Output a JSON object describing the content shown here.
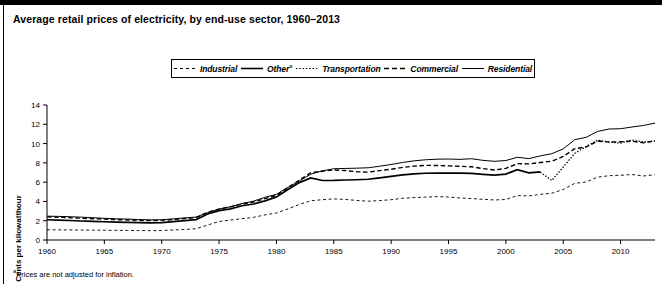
{
  "figure": {
    "title": "Average retail prices of electricity, by end-use sector, 1960–2013",
    "footnote_marker": "a",
    "footnote_text": "Prices are not adjusted for inflation.",
    "border_color": "#000000",
    "background_color": "#ffffff"
  },
  "legend": {
    "position": "top-center",
    "items": [
      {
        "label": "Industrial",
        "style": "dashed",
        "dash": "3,3",
        "width": 1,
        "color": "#000000",
        "superscript": ""
      },
      {
        "label": "Other",
        "style": "solid",
        "dash": "",
        "width": 1.6,
        "color": "#000000",
        "superscript": "a"
      },
      {
        "label": "Transportation",
        "style": "dotted",
        "dash": "1.5,1.8",
        "width": 1.2,
        "color": "#000000",
        "superscript": ""
      },
      {
        "label": "Commercial",
        "style": "dashed",
        "dash": "5,3",
        "width": 1.4,
        "color": "#000000",
        "superscript": ""
      },
      {
        "label": "Residential",
        "style": "solid",
        "dash": "",
        "width": 1,
        "color": "#000000",
        "superscript": ""
      }
    ]
  },
  "chart_data": {
    "type": "line",
    "title": "Average retail prices of electricity, by end-use sector, 1960–2013",
    "xlabel": "",
    "ylabel": "Cents per kilowatthour",
    "xlim": [
      1960,
      2013
    ],
    "ylim": [
      0,
      14
    ],
    "yticks": [
      0,
      2,
      4,
      6,
      8,
      10,
      12,
      14
    ],
    "xticks": [
      1960,
      1965,
      1970,
      1975,
      1980,
      1985,
      1990,
      1995,
      2000,
      2005,
      2010
    ],
    "grid": false,
    "legend_position": "top-center",
    "x": [
      1960,
      1961,
      1962,
      1963,
      1964,
      1965,
      1966,
      1967,
      1968,
      1969,
      1970,
      1971,
      1972,
      1973,
      1974,
      1975,
      1976,
      1977,
      1978,
      1979,
      1980,
      1981,
      1982,
      1983,
      1984,
      1985,
      1986,
      1987,
      1988,
      1989,
      1990,
      1991,
      1992,
      1993,
      1994,
      1995,
      1996,
      1997,
      1998,
      1999,
      2000,
      2001,
      2002,
      2003,
      2004,
      2005,
      2006,
      2007,
      2008,
      2009,
      2010,
      2011,
      2012,
      2013
    ],
    "series": [
      {
        "name": "Residential",
        "style": "solid",
        "units": "cents per kilowatthour",
        "values": [
          2.47,
          2.45,
          2.41,
          2.37,
          2.31,
          2.25,
          2.2,
          2.17,
          2.12,
          2.09,
          2.1,
          2.19,
          2.29,
          2.38,
          2.83,
          3.21,
          3.45,
          3.78,
          4.03,
          4.43,
          4.73,
          5.46,
          6.12,
          6.83,
          7.17,
          7.39,
          7.42,
          7.45,
          7.49,
          7.65,
          7.83,
          8.04,
          8.21,
          8.32,
          8.38,
          8.4,
          8.36,
          8.43,
          8.26,
          8.16,
          8.24,
          8.58,
          8.44,
          8.72,
          8.95,
          9.45,
          10.4,
          10.65,
          11.26,
          11.51,
          11.54,
          11.72,
          11.88,
          12.12
        ]
      },
      {
        "name": "Commercial",
        "style": "dashed",
        "units": "cents per kilowatthour",
        "values": [
          2.4,
          2.36,
          2.31,
          2.26,
          2.21,
          2.16,
          2.11,
          2.08,
          2.04,
          2.01,
          2.03,
          2.13,
          2.23,
          2.32,
          2.88,
          3.2,
          3.44,
          3.73,
          3.94,
          4.29,
          4.62,
          5.43,
          6.21,
          6.98,
          7.13,
          7.27,
          7.2,
          7.08,
          7.04,
          7.2,
          7.34,
          7.53,
          7.66,
          7.74,
          7.73,
          7.69,
          7.64,
          7.59,
          7.41,
          7.26,
          7.43,
          7.92,
          7.89,
          8.03,
          8.17,
          8.67,
          9.46,
          9.65,
          10.26,
          10.16,
          10.19,
          10.24,
          10.09,
          10.26
        ]
      },
      {
        "name": "Other",
        "style": "solid-bold",
        "units": "cents per kilowatthour",
        "ends_at": 2003,
        "values": [
          2.1,
          2.06,
          2.02,
          1.97,
          1.93,
          1.89,
          1.85,
          1.83,
          1.8,
          1.78,
          1.8,
          1.9,
          2.0,
          2.12,
          2.7,
          3.05,
          3.23,
          3.55,
          3.73,
          4.06,
          4.45,
          5.24,
          5.95,
          6.44,
          6.17,
          6.18,
          6.22,
          6.25,
          6.3,
          6.45,
          6.6,
          6.75,
          6.85,
          6.92,
          6.94,
          6.95,
          6.93,
          6.9,
          6.8,
          6.72,
          6.84,
          7.3,
          6.96,
          7.06,
          null,
          null,
          null,
          null,
          null,
          null,
          null,
          null,
          null,
          null
        ]
      },
      {
        "name": "Transportation",
        "style": "dotted",
        "units": "cents per kilowatthour",
        "starts_at": 2003,
        "values": [
          null,
          null,
          null,
          null,
          null,
          null,
          null,
          null,
          null,
          null,
          null,
          null,
          null,
          null,
          null,
          null,
          null,
          null,
          null,
          null,
          null,
          null,
          null,
          null,
          null,
          null,
          null,
          null,
          null,
          null,
          null,
          null,
          null,
          null,
          null,
          null,
          null,
          null,
          null,
          null,
          null,
          null,
          null,
          7.04,
          6.17,
          7.56,
          8.99,
          9.7,
          10.35,
          10.15,
          10.05,
          10.37,
          10.15,
          10.28
        ]
      },
      {
        "name": "Industrial",
        "style": "dashed-light",
        "units": "cents per kilowatthour",
        "values": [
          1.06,
          1.05,
          1.04,
          1.03,
          1.02,
          1.01,
          1.0,
          0.99,
          0.98,
          0.97,
          0.98,
          1.04,
          1.09,
          1.17,
          1.55,
          1.92,
          2.07,
          2.21,
          2.35,
          2.6,
          2.8,
          3.23,
          3.69,
          4.07,
          4.18,
          4.26,
          4.21,
          4.1,
          4.02,
          4.09,
          4.18,
          4.32,
          4.4,
          4.45,
          4.5,
          4.46,
          4.36,
          4.3,
          4.22,
          4.15,
          4.2,
          4.6,
          4.57,
          4.73,
          4.85,
          5.24,
          5.87,
          6.02,
          6.52,
          6.67,
          6.71,
          6.79,
          6.64,
          6.77
        ]
      }
    ]
  },
  "axes": {
    "y_axis_label": "Cents per kilowatthour",
    "y_tick_labels": [
      "0",
      "2",
      "4",
      "6",
      "8",
      "10",
      "12",
      "14"
    ],
    "x_tick_labels": [
      "1960",
      "1965",
      "1970",
      "1975",
      "1980",
      "1985",
      "1990",
      "1995",
      "2000",
      "2005",
      "2010"
    ]
  }
}
